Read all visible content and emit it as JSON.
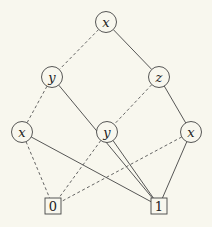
{
  "diagram": {
    "type": "binary-decision-diagram",
    "nodes": [
      {
        "id": "n_x_top",
        "label": "x",
        "shape": "circle",
        "cx": 106,
        "cy": 22
      },
      {
        "id": "n_y_left",
        "label": "y",
        "shape": "circle",
        "cx": 52,
        "cy": 77
      },
      {
        "id": "n_z_right",
        "label": "z",
        "shape": "circle",
        "cx": 159,
        "cy": 77
      },
      {
        "id": "n_x_left",
        "label": "x",
        "shape": "circle",
        "cx": 22,
        "cy": 132
      },
      {
        "id": "n_y_mid",
        "label": "y",
        "shape": "circle",
        "cx": 107,
        "cy": 132
      },
      {
        "id": "n_x_right",
        "label": "x",
        "shape": "circle",
        "cx": 191,
        "cy": 132
      },
      {
        "id": "t_0",
        "label": "0",
        "shape": "square",
        "cx": 53,
        "cy": 206
      },
      {
        "id": "t_1",
        "label": "1",
        "shape": "square",
        "cx": 159,
        "cy": 206
      }
    ],
    "edges": [
      {
        "from": "n_x_top",
        "to": "n_y_left",
        "style": "dashed"
      },
      {
        "from": "n_x_top",
        "to": "n_z_right",
        "style": "solid"
      },
      {
        "from": "n_y_left",
        "to": "n_x_left",
        "style": "dashed"
      },
      {
        "from": "n_y_left",
        "to": "t_1",
        "style": "solid"
      },
      {
        "from": "n_z_right",
        "to": "n_y_mid",
        "style": "dashed"
      },
      {
        "from": "n_z_right",
        "to": "n_x_right",
        "style": "solid"
      },
      {
        "from": "n_x_left",
        "to": "t_0",
        "style": "dashed"
      },
      {
        "from": "n_x_left",
        "to": "t_1",
        "style": "solid"
      },
      {
        "from": "n_y_mid",
        "to": "t_0",
        "style": "dashed"
      },
      {
        "from": "n_y_mid",
        "to": "t_1",
        "style": "solid"
      },
      {
        "from": "n_x_right",
        "to": "t_0",
        "style": "dashed"
      },
      {
        "from": "n_x_right",
        "to": "t_1",
        "style": "solid"
      }
    ],
    "colors": {
      "background": "#f8f7ee",
      "stroke": "#444444",
      "text": "#222222"
    }
  }
}
